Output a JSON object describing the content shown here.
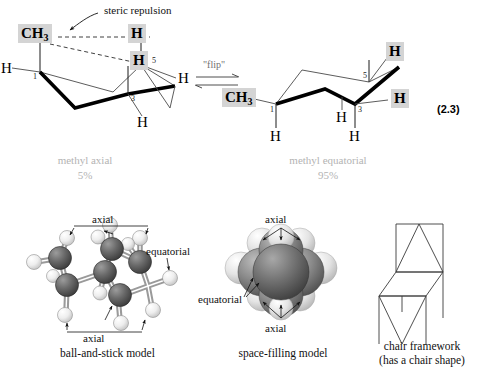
{
  "figure": {
    "equation_number": "(2.3)",
    "reaction_label": "\"flip\"",
    "steric_label": "steric repulsion"
  },
  "left_structure": {
    "name": "methyl axial chair",
    "methyl_label": "CH",
    "methyl_sub": "3",
    "axial_h_top": "H",
    "h_c5": "H",
    "h_left": "H",
    "h_right": "H",
    "h_bottom": "H",
    "carbon_1": "1",
    "carbon_3": "3",
    "carbon_5": "5",
    "caption": "methyl axial",
    "percent": "5%"
  },
  "right_structure": {
    "name": "methyl equatorial chair",
    "methyl_label": "CH",
    "methyl_sub": "3",
    "h_top": "H",
    "h_right": "H",
    "h_mid": "H",
    "h_lower_left": "H",
    "h_lower_right": "H",
    "carbon_1": "1",
    "carbon_3": "3",
    "carbon_5": "5",
    "caption": "methyl equatorial",
    "percent": "95%"
  },
  "models": {
    "ball_and_stick": {
      "caption": "ball-and-stick model",
      "axial_top": "axial",
      "axial_bottom": "axial",
      "equatorial": "equatorial"
    },
    "space_filling": {
      "caption": "space-filling model",
      "axial_top": "axial",
      "axial_bottom": "axial",
      "equatorial": "equatorial"
    },
    "chair_framework": {
      "caption_line1": "chair framework",
      "caption_line2": "(has a chair shape)"
    }
  },
  "colors": {
    "highlight": "#d4d4d4",
    "gray_caption": "#b3b3b3",
    "bond_thin": "#555555",
    "bond_bold": "#000000",
    "carbon_ball": "#5a5a5a",
    "hydrogen_ball": "#e8e8e8"
  }
}
